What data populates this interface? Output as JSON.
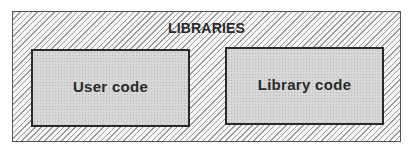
{
  "diagram": {
    "container": {
      "label": "LIBRARIES",
      "fill_pattern": "diagonal-hatch",
      "border_color": "#555555"
    },
    "boxes": [
      {
        "label": "User code",
        "fill_pattern": "stipple-gray",
        "border_color": "#2a2a2a"
      },
      {
        "label": "Library code",
        "fill_pattern": "stipple-gray",
        "border_color": "#2a2a2a"
      }
    ]
  }
}
